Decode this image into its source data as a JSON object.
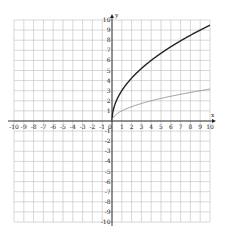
{
  "chart_data": {
    "type": "line",
    "title": "",
    "xlabel": "x",
    "ylabel": "y",
    "xlim": [
      -10,
      10
    ],
    "ylim": [
      -10,
      10
    ],
    "grid": true,
    "legend": "none",
    "x_ticks": [
      -10,
      -9,
      -8,
      -7,
      -6,
      -5,
      -4,
      -3,
      -2,
      -1,
      0,
      1,
      2,
      3,
      4,
      5,
      6,
      7,
      8,
      9,
      10
    ],
    "y_ticks": [
      -10,
      -9,
      -8,
      -7,
      -6,
      -5,
      -4,
      -3,
      -2,
      -1,
      1,
      2,
      3,
      4,
      5,
      6,
      7,
      8,
      9,
      10
    ],
    "series": [
      {
        "name": "y = 3√x",
        "color": "#222222",
        "x": [
          0,
          0.25,
          1,
          2,
          3,
          4,
          5,
          6,
          7,
          8,
          9,
          10
        ],
        "values": [
          0,
          1.5,
          3,
          4.24,
          5.2,
          6,
          6.71,
          7.35,
          7.94,
          8.49,
          9,
          9.49
        ]
      },
      {
        "name": "y = √x",
        "color": "#888888",
        "x": [
          0,
          0.25,
          1,
          2,
          3,
          4,
          5,
          6,
          7,
          8,
          9,
          10
        ],
        "values": [
          0,
          0.5,
          1,
          1.41,
          1.73,
          2,
          2.24,
          2.45,
          2.65,
          2.83,
          3,
          3.16
        ]
      }
    ]
  },
  "axes": {
    "x_label": "x",
    "y_label": "y"
  }
}
